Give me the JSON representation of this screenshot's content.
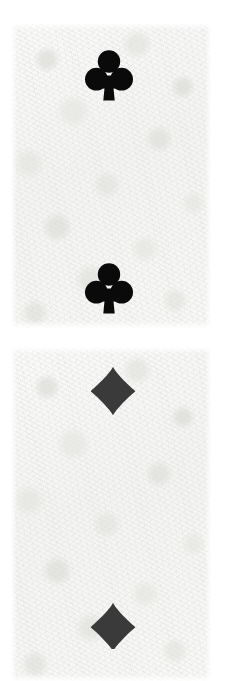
{
  "scene": {
    "title": "Playing card suit symbols",
    "description": "Two scanned paper card fragments stacked vertically on a white background; the upper fragment carries two black club pips, the lower fragment carries two dark charcoal diamond pips, the lowest of which is cropped by the frame edge.",
    "background_color": "#ffffff",
    "width": 226,
    "height": 681
  },
  "palette": {
    "page_background": "#ffffff",
    "paper_base": "#f7f7f6",
    "paper_highlight": "#fafafa",
    "paper_shadow": "#e2e2de",
    "club_ink": "#0a0a0a",
    "diamond_ink": "#3a3a3a"
  },
  "cards": [
    {
      "id": "card-top",
      "name": "upper-card-fragment",
      "suit": "clubs",
      "suit_glyph": "♣",
      "ink_color": "#0a0a0a",
      "pip_count": 2,
      "bounds": {
        "x": 11,
        "y": 23,
        "width": 200,
        "height": 305
      }
    },
    {
      "id": "card-bottom",
      "name": "lower-card-fragment",
      "suit": "diamonds",
      "suit_glyph": "♦",
      "ink_color": "#3a3a3a",
      "pip_count": 2,
      "bounds": {
        "x": 11,
        "y": 347,
        "width": 200,
        "height": 334
      }
    }
  ],
  "pips": [
    {
      "id": "pip-club-1",
      "name": "club-pip-top",
      "suit": "clubs",
      "glyph": "♣",
      "color": "#0a0a0a",
      "position": "upper",
      "cropped": false,
      "bounds": {
        "x": 85,
        "y": 48,
        "width": 48,
        "height": 53
      }
    },
    {
      "id": "pip-club-2",
      "name": "club-pip-bottom",
      "suit": "clubs",
      "glyph": "♣",
      "color": "#0a0a0a",
      "position": "lower",
      "cropped": false,
      "bounds": {
        "x": 85,
        "y": 261,
        "width": 48,
        "height": 53
      }
    },
    {
      "id": "pip-diamond-1",
      "name": "diamond-pip-top",
      "suit": "diamonds",
      "glyph": "♦",
      "color": "#3a3a3a",
      "position": "upper",
      "cropped": false,
      "bounds": {
        "x": 90,
        "y": 366,
        "width": 46,
        "height": 50
      }
    },
    {
      "id": "pip-diamond-2",
      "name": "diamond-pip-bottom",
      "suit": "diamonds",
      "glyph": "♦",
      "color": "#3a3a3a",
      "position": "lower",
      "cropped": true,
      "bounds": {
        "x": 90,
        "y": 602,
        "width": 46,
        "height": 47
      }
    }
  ]
}
